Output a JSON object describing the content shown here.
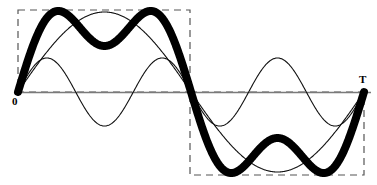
{
  "figure": {
    "background_color": "#ffffff",
    "width": 377,
    "height": 185,
    "axis_color": "#808080",
    "curve_color": "#000000",
    "dashed_color": "#555555"
  },
  "labels": {
    "origin": "0",
    "period": "T"
  },
  "icons": {
    "origin_marker": "origin-label",
    "period_marker": "period-label"
  },
  "chart_data": {
    "type": "line",
    "xlabel": "",
    "ylabel": "",
    "grid": false,
    "legend": "none",
    "xlim": [
      0,
      1
    ],
    "ylim": [
      -1.3,
      1.3
    ],
    "x_tick_labels": [
      "0",
      "T"
    ],
    "x_tick_values": [
      0,
      1
    ],
    "axis_y_value": 0,
    "geometry_px": {
      "origin_x": 18,
      "origin_y": 92,
      "period_end_x": 364,
      "half_period_x": 190,
      "axis_line_y": 92,
      "axis_line_x_start": 18,
      "axis_line_x_end": 371,
      "fundamental_amplitude_px": 80,
      "third_harmonic_amplitude_px": 34,
      "sum_peak_px": 80,
      "thick_line_width_px": 8,
      "thin_line_width_px": 1
    },
    "annotations": [
      {
        "text": "0",
        "x_px": 16,
        "y_px": 103,
        "bold": true
      },
      {
        "text": "T",
        "x_px": 362,
        "y_px": 82,
        "bold": true
      }
    ],
    "dashed_boxes": [
      {
        "name": "positive-half-box",
        "x0_px": 18,
        "y0_px": 10,
        "x1_px": 190,
        "y1_px": 92
      },
      {
        "name": "negative-half-box",
        "x0_px": 190,
        "y0_px": 92,
        "x1_px": 364,
        "y1_px": 175
      }
    ],
    "series": [
      {
        "name": "fundamental",
        "harmonic": 1,
        "amplitude": 1.0,
        "phase": 0,
        "style": "thin",
        "formula": "sin(2*pi*x)",
        "values_sampled": [
          0.0,
          0.309,
          0.588,
          0.809,
          0.951,
          1.0,
          0.951,
          0.809,
          0.588,
          0.309,
          0.0,
          -0.309,
          -0.588,
          -0.809,
          -0.951,
          -1.0,
          -0.951,
          -0.809,
          -0.588,
          -0.309,
          0.0
        ]
      },
      {
        "name": "third-harmonic",
        "harmonic": 3,
        "amplitude": 0.43,
        "phase": 0,
        "style": "thin",
        "formula": "0.43*sin(6*pi*x)",
        "values_sampled": [
          0.0,
          0.409,
          0.253,
          -0.253,
          -0.409,
          0.0,
          0.409,
          0.253,
          -0.253,
          -0.409,
          0.0,
          0.409,
          0.253,
          -0.253,
          -0.409,
          0.0,
          0.409,
          0.253,
          -0.253,
          -0.409,
          0.0
        ]
      },
      {
        "name": "sum-resultant",
        "harmonic": "1+3",
        "amplitude": 1.0,
        "style": "thick",
        "formula": "sin(2*pi*x) + 0.43*sin(6*pi*x)",
        "values_sampled": [
          0.0,
          0.718,
          0.841,
          0.556,
          0.542,
          1.0,
          1.36,
          1.062,
          0.335,
          -0.1,
          0.0,
          0.1,
          -0.335,
          -1.062,
          -1.36,
          -1.0,
          -0.542,
          -0.556,
          -0.841,
          -0.718,
          0.0
        ]
      }
    ]
  }
}
